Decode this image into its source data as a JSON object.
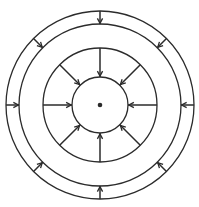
{
  "diagram": {
    "type": "concentric-circles-with-inward-arrows",
    "colors": {
      "stroke": "#2b2b2b",
      "background": "#ffffff"
    },
    "center": {
      "x": 100,
      "y": 105
    },
    "circles": [
      {
        "name": "outer-circle",
        "r": 94
      },
      {
        "name": "second-circle",
        "r": 81
      },
      {
        "name": "third-circle",
        "r": 57
      },
      {
        "name": "inner-circle",
        "r": 28
      }
    ],
    "center_dot": {
      "r": 2.3
    },
    "outer_ring_arrows": {
      "count": 8,
      "angles_deg": [
        0,
        45,
        90,
        135,
        180,
        225,
        270,
        315
      ],
      "from_r": 94,
      "to_r": 81,
      "direction": "inward"
    },
    "spoke_arrows": {
      "count": 8,
      "angles_deg": [
        0,
        45,
        90,
        135,
        180,
        225,
        270,
        315
      ],
      "from_r": 57,
      "to_r": 28,
      "direction": "inward"
    }
  }
}
